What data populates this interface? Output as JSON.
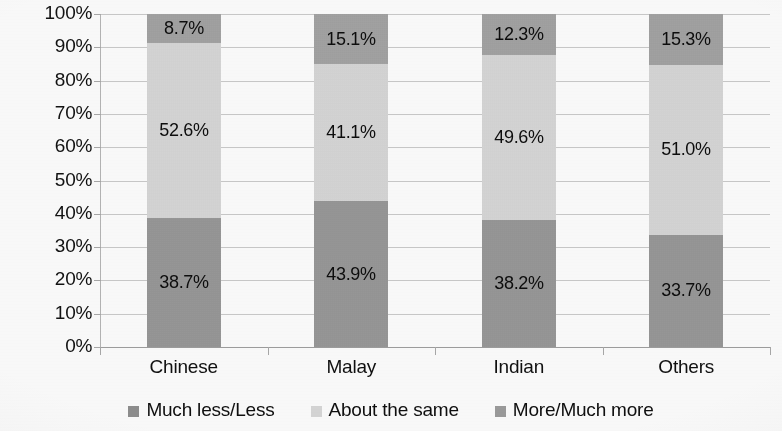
{
  "chart_data": {
    "type": "bar",
    "stacked": true,
    "stack_mode": "percent",
    "title": "",
    "subtitle": "",
    "xlabel": "",
    "ylabel": "",
    "categories": [
      "Chinese",
      "Malay",
      "Indian",
      "Others"
    ],
    "ylim": [
      0,
      100
    ],
    "y_ticks": [
      "0%",
      "10%",
      "20%",
      "30%",
      "40%",
      "50%",
      "60%",
      "70%",
      "80%",
      "90%",
      "100%"
    ],
    "y_tick_values": [
      0,
      10,
      20,
      30,
      40,
      50,
      60,
      70,
      80,
      90,
      100
    ],
    "grid": true,
    "grid_axis": "y",
    "legend_position": "bottom",
    "series": [
      {
        "name": "Much less/Less",
        "color": "#8e8e8e",
        "values": [
          38.7,
          43.9,
          38.2,
          33.7
        ],
        "labels": [
          "38.7%",
          "43.9%",
          "38.2%",
          "33.7%"
        ]
      },
      {
        "name": "About the same",
        "color": "#d6d6d6",
        "values": [
          52.6,
          41.1,
          49.6,
          51.0
        ],
        "labels": [
          "52.6%",
          "41.1%",
          "49.6%",
          "51.0%"
        ]
      },
      {
        "name": "More/Much more",
        "color": "#9b9b9b",
        "values": [
          8.7,
          15.1,
          12.3,
          15.3
        ],
        "labels": [
          "8.7%",
          "15.1%",
          "12.3%",
          "15.3%"
        ]
      }
    ]
  },
  "colors": {
    "much_less": "#8e8e8e",
    "about_same": "#d6d6d6",
    "more": "#9b9b9b",
    "gridline": "#c9c9c9",
    "axis": "#a8a8a8",
    "text": "#101010",
    "background": "#fbfbfb"
  },
  "axis": {
    "y_labels": [
      "100%",
      "90%",
      "80%",
      "70%",
      "60%",
      "50%",
      "40%",
      "30%",
      "20%",
      "10%",
      "0%"
    ],
    "x_labels": [
      "Chinese",
      "Malay",
      "Indian",
      "Others"
    ]
  },
  "legend": {
    "items": [
      {
        "label": "Much less/Less",
        "color": "#8e8e8e"
      },
      {
        "label": "About the same",
        "color": "#d6d6d6"
      },
      {
        "label": "More/Much more",
        "color": "#9b9b9b"
      }
    ]
  }
}
